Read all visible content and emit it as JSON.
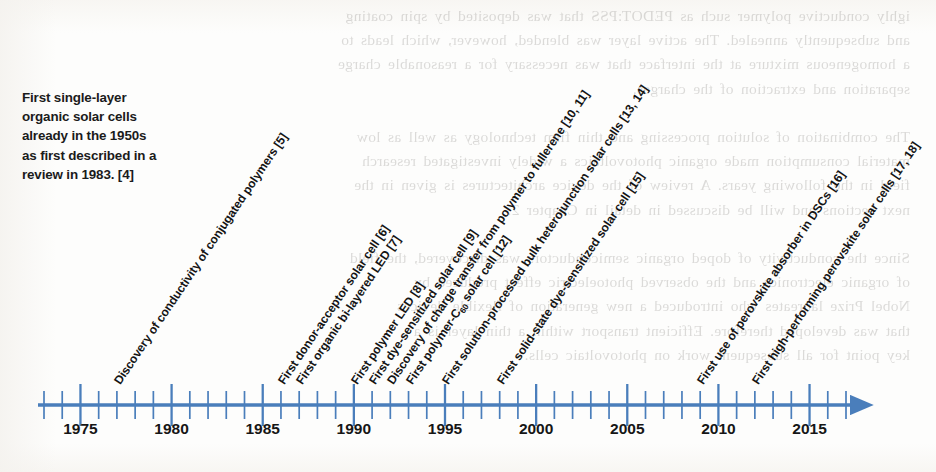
{
  "figure": {
    "type": "timeline",
    "note": {
      "lines": [
        "First single-layer",
        "organic solar cells",
        "already in the 1950s",
        "as first described in a",
        "review in 1983. [4]"
      ]
    },
    "axis": {
      "color": "#4a7ebb",
      "year_min": 1973,
      "year_max": 2017,
      "minor_tick_step": 1,
      "labeled_tick_step": 5,
      "arrow_end": "right",
      "tick_labels": [
        "1975",
        "1980",
        "1985",
        "1990",
        "1995",
        "2000",
        "2005",
        "2010",
        "2015"
      ],
      "tick_label_years": [
        1975,
        1980,
        1985,
        1990,
        1995,
        2000,
        2005,
        2010,
        2015
      ]
    },
    "events": [
      {
        "year": 1977,
        "label": "Discovery of conductivity of conjugated polymers [5]"
      },
      {
        "year": 1986,
        "label": "First donor-acceptor solar cell [6]"
      },
      {
        "year": 1987,
        "label": "First organic bi-layered LED [7]"
      },
      {
        "year": 1990,
        "label": "First polymer LED [8]"
      },
      {
        "year": 1991,
        "label": "First dye-sensitized solar cell [9]"
      },
      {
        "year": 1992,
        "label": "Discovery of charge transfer from polymer to fullerene [10, 11]"
      },
      {
        "year": 1993,
        "label": "First polymer-C|60| solar cell [12]"
      },
      {
        "year": 1995,
        "label": "First solution-processed bulk heterojunction solar cells [13, 14]"
      },
      {
        "year": 1998,
        "label": "First solid-state dye-sensitized solar cell [15]"
      },
      {
        "year": 2009,
        "label": "First use of perovskite absorber in DSCs [16]"
      },
      {
        "year": 2012,
        "label": "First high-performing perovskite solar cells [17, 18]"
      }
    ]
  },
  "bleedthrough": {
    "text": "ighly conductive polymer such as PEDOT:PSS that was deposited by spin coating\nand subsequently annealed. The active layer was blended, however, which leads to\na homogeneous mixture at the interface that was necessary for a reasonable charge\nseparation and extraction of the charges.\n\nThe combination of solution processing and thin film technology as well as low\nmaterial consumption made organic photovoltaics a widely investigated research\nfield in the following years. A review of the device architectures is given in the\nnext sections and will be discussed in detail in Chapter 2.\n\nSince the conductivity of doped organic semiconductors was discovered, the field\nof organic electronics and the observed photoelectric effect produced by\nNobel Prize laureates who introduced a new generation of flexible devices\nthat was developed therefore. Efficient transport within a thin layer is a\nkey point for all subsequent work on photovoltaic cells."
  }
}
